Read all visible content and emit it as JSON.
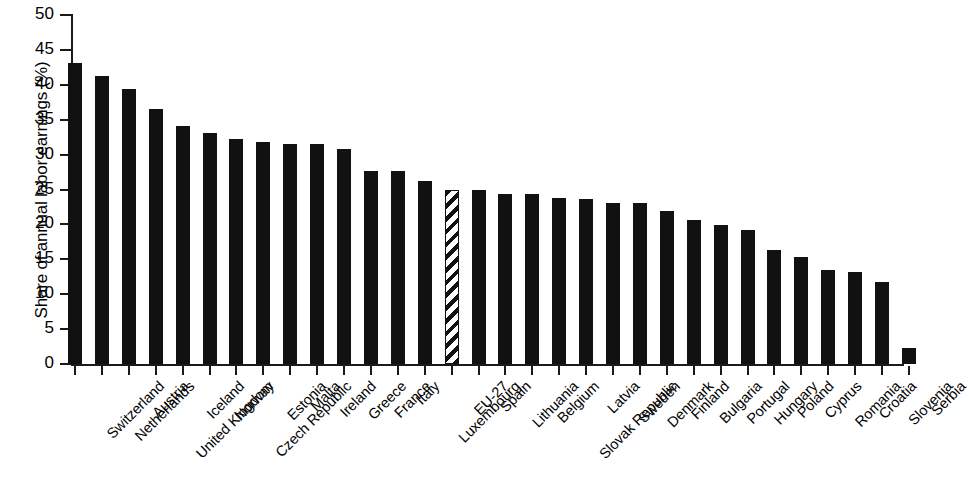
{
  "chart_data": {
    "type": "bar",
    "title": "",
    "subtitle": "",
    "xlabel": "",
    "ylabel": "Share of annual labor earnings (%)",
    "ylim": [
      0,
      50
    ],
    "ytick_step": 5,
    "yticks": [
      "0",
      "5",
      "10",
      "15",
      "20",
      "25",
      "30",
      "35",
      "40",
      "45",
      "50"
    ],
    "grid": false,
    "legend": "none",
    "bar_color": "#111111",
    "highlight_category": "EU-27",
    "highlight_style": "diagonal-hatch",
    "categories": [
      "Switzerland",
      "Netherlands",
      "Austria",
      "United Kingdom",
      "Iceland",
      "Norway",
      "Czech Republic",
      "Estonia",
      "Malta",
      "Ireland",
      "Greece",
      "France",
      "Italy",
      "Luxembourg",
      "EU-27",
      "Spain",
      "Lithuania",
      "Belgium",
      "Slovak Republic",
      "Latvia",
      "Sweden",
      "Denmark",
      "Finland",
      "Bulgaria",
      "Portugal",
      "Hungary",
      "Poland",
      "Cyprus",
      "Romania",
      "Croatia",
      "Slovenia",
      "Serbia"
    ],
    "values": [
      43.1,
      41.2,
      39.4,
      36.5,
      34.1,
      33.1,
      32.3,
      31.8,
      31.5,
      31.5,
      30.8,
      27.6,
      27.6,
      26.2,
      24.9,
      24.9,
      24.4,
      24.3,
      23.8,
      23.6,
      23.1,
      23.0,
      21.9,
      20.6,
      19.9,
      19.2,
      16.4,
      15.3,
      13.4,
      13.2,
      11.8,
      2.3
    ]
  }
}
